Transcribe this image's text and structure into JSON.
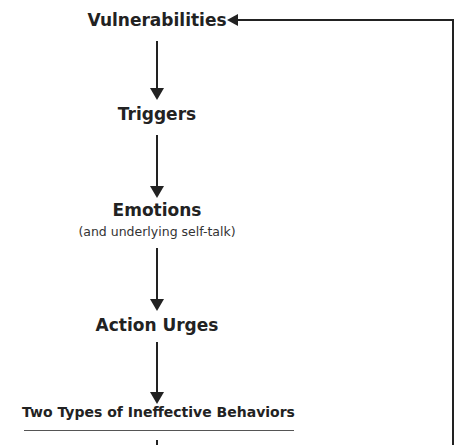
{
  "diagram": {
    "nodes": [
      {
        "label": "Vulnerabilities"
      },
      {
        "label": "Triggers"
      },
      {
        "label": "Emotions",
        "sublabel": "(and underlying self-talk)"
      },
      {
        "label": "Action Urges"
      }
    ],
    "section_heading": "Two Types of Ineffective Behaviors",
    "colors": {
      "line": "#222222",
      "text": "#222222"
    }
  }
}
